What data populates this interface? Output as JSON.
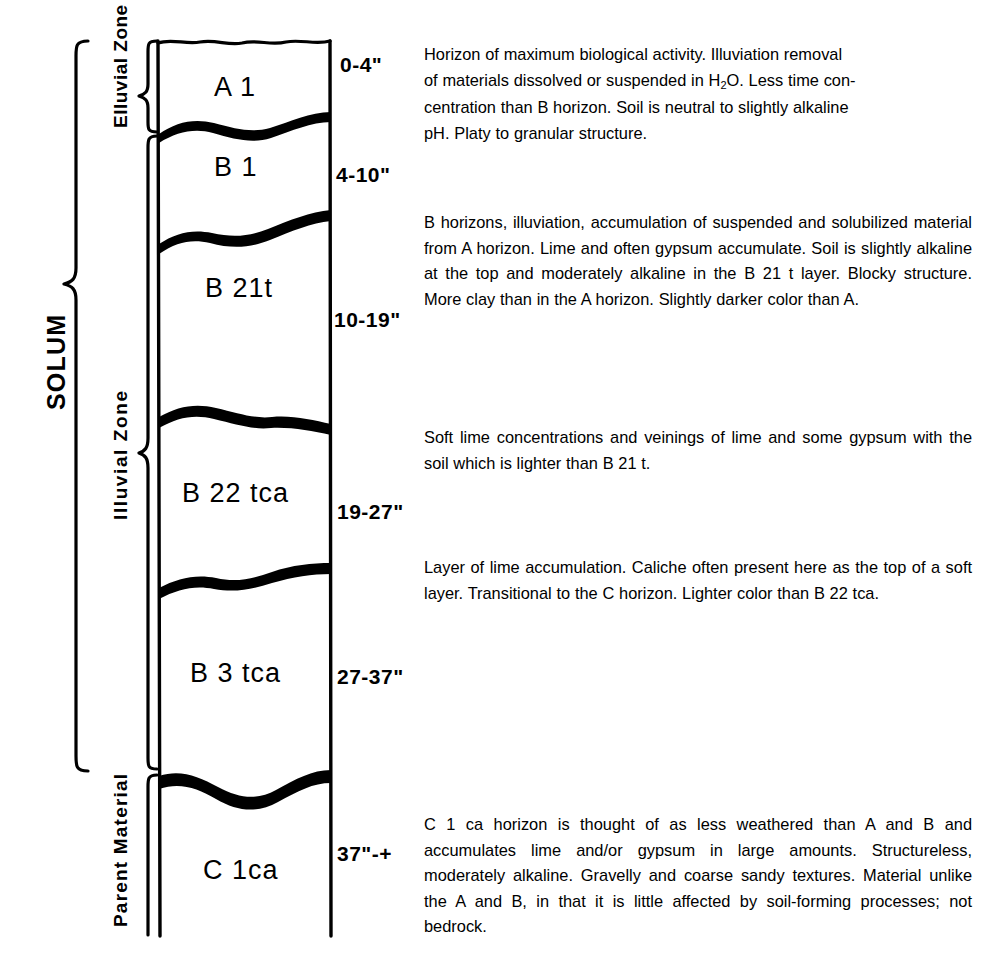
{
  "figure": {
    "ink_color": "#000000",
    "background_color": "#ffffff"
  },
  "zones": {
    "solum": "SOLUM",
    "elluvial": "Elluvial Zone",
    "illuvial": "Illuvial Zone",
    "parent": "Parent Material"
  },
  "horizons": [
    {
      "name": "A 1",
      "depth": "0-4\"",
      "description": "Horizon of maximum biological activity. Illuviation removal of materials dissolved or suspended in H2O. Less time concentration than B horizon. Soil is neutral to slightly alkaline pH. Platy to granular structure."
    },
    {
      "name": "B 1",
      "depth": "4-10\"",
      "description": "B horizons, illuviation, accumulation of suspended and solubilized material from A horizon. Lime and often gypsum accumulate. Soil is slightly alkaline at the top and moderately alkaline in the B 21 t layer. Blocky structure. More clay than in the A horizon. Slightly darker color than A."
    },
    {
      "name": "B 21t",
      "depth": "10-19\"",
      "description": ""
    },
    {
      "name": "B 22 tca",
      "depth": "19-27\"",
      "description": "Soft lime concentrations and veinings of lime and some gypsum with the soil which is lighter than B 21 t."
    },
    {
      "name": "B 3 tca",
      "depth": "27-37\"",
      "description": "Layer of lime accumulation. Caliche often present here as the top of a soft layer. Transitional to the C horizon. Lighter color than B 22 tca."
    },
    {
      "name": "C 1ca",
      "depth": "37\"-+",
      "description": "C 1 ca horizon is thought of as less weathered than A and B and accumulates lime and/or gypsum in large amounts. Structureless, moderately alkaline. Gravelly and coarse sandy textures. Material unlike the A and B, in that it is little affected by soil-forming processes; not bedrock."
    }
  ],
  "descriptions": {
    "a1_line1": "Horizon of maximum biological activity. Illuviation removal",
    "a1_line2_pre": "of materials dissolved or suspended in H",
    "a1_line2_sub": "2",
    "a1_line2_post": "O. Less time con-",
    "a1_line3": "centration than B horizon. Soil is neutral to slightly alkaline",
    "a1_line4": "pH. Platy to granular structure.",
    "b_block": "B horizons, illuviation, accumulation of suspended and solubilized material from A horizon. Lime and often gypsum accumulate. Soil is slightly alkaline at the top and moderately alkaline in the B 21 t layer. Blocky structure. More clay than in the A horizon. Slightly darker color than A.",
    "b22_block": "Soft lime concentrations and veinings of lime and some gypsum with the soil which is lighter than B 21 t.",
    "b3_block": "Layer of lime accumulation. Caliche often present here as the top of a soft layer. Transitional to the C horizon. Lighter color than B 22 tca.",
    "c1_block": "C 1 ca horizon is thought of as less weathered than A and B and accumulates lime and/or gypsum in large amounts. Structureless, moderately alkaline. Gravelly and coarse sandy textures. Material unlike the A and B, in that it is little affected by soil-forming processes; not bedrock."
  }
}
